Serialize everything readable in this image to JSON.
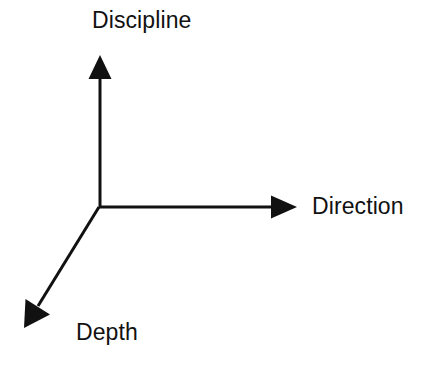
{
  "diagram": {
    "background_color": "#ffffff",
    "stroke_color": "#111111",
    "stroke_width": 3,
    "origin": {
      "x": 99,
      "y": 207
    },
    "axes": [
      {
        "id": "discipline",
        "label": "Discipline",
        "direction": "up",
        "tip": {
          "x": 100,
          "y": 56
        },
        "arrowhead": "solid-triangle"
      },
      {
        "id": "direction",
        "label": "Direction",
        "direction": "right",
        "tip": {
          "x": 296,
          "y": 207
        },
        "arrowhead": "solid-triangle"
      },
      {
        "id": "depth",
        "label": "Depth",
        "direction": "down-left",
        "tip": {
          "x": 25,
          "y": 327
        },
        "arrowhead": "solid-triangle"
      }
    ]
  },
  "labels": {
    "discipline": "Discipline",
    "direction": "Direction",
    "depth": "Depth"
  }
}
